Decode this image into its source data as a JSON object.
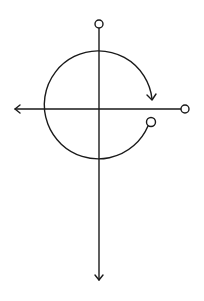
{
  "diagram": {
    "type": "rotation-axes",
    "stroke_color": "#1a1a1a",
    "background": "#ffffff",
    "vertical_axis": {
      "x": 99,
      "y_start": 28,
      "y_end": 280,
      "end_marker": "arrow-down",
      "start_marker": "open-circle"
    },
    "horizontal_axis": {
      "y": 109,
      "x_start": 15,
      "x_end": 181,
      "start_marker": "arrow-left",
      "end_marker": "open-circle"
    },
    "rotation_arc": {
      "center": [
        99,
        109
      ],
      "radius": 54,
      "direction": "clockwise",
      "start_marker": "open-circle",
      "end_marker": "arrow"
    },
    "nodes": [
      {
        "name": "top-node",
        "cx": 99,
        "cy": 24,
        "r": 4
      },
      {
        "name": "right-node",
        "cx": 185,
        "cy": 109,
        "r": 4
      },
      {
        "name": "arc-start-node",
        "cx": 151,
        "cy": 122,
        "r": 4.5
      }
    ]
  }
}
